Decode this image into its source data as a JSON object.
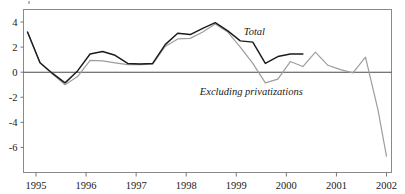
{
  "chart_data": {
    "type": "line",
    "title": "",
    "subtitle": "",
    "xlabel": "",
    "ylabel": "",
    "grid": false,
    "legend_position": "inline-annotations",
    "xlim": [
      1994.75,
      2002.1
    ],
    "ylim": [
      -8.0,
      5.0
    ],
    "yticks": [
      4,
      2,
      0,
      -2,
      -4,
      -6
    ],
    "ytick_labels": [
      "4",
      "2",
      "0",
      "-2",
      "-4",
      "-6"
    ],
    "xticks": [
      1995,
      1996,
      1997,
      1998,
      1999,
      2000,
      2001,
      2002
    ],
    "xtick_labels": [
      "1995",
      "1996",
      "1997",
      "1998",
      "1999",
      "2000",
      "2001",
      "2002"
    ],
    "annotations": [
      {
        "text": "Total",
        "x": 1999.15,
        "y": 3.0
      },
      {
        "text": "Excluding privatizations",
        "x": 1999.3,
        "y": -1.85
      }
    ],
    "series": [
      {
        "name": "Total",
        "color": "#1b1b1b",
        "x": [
          1994.83,
          1995.08,
          1995.33,
          1995.58,
          1995.83,
          1996.08,
          1996.33,
          1996.58,
          1996.83,
          1997.08,
          1997.33,
          1997.58,
          1997.83,
          1998.08,
          1998.33,
          1998.58,
          1998.83,
          1999.08,
          1999.33,
          1999.58,
          1999.83,
          2000.08,
          2000.33
        ],
        "values": [
          3.2,
          0.75,
          -0.1,
          -0.85,
          0.1,
          1.45,
          1.65,
          1.35,
          0.7,
          0.65,
          0.7,
          2.2,
          3.1,
          3.0,
          3.5,
          3.95,
          3.3,
          2.5,
          2.4,
          0.7,
          1.25,
          1.45,
          1.45
        ]
      },
      {
        "name": "Excluding privatizations",
        "color": "#9d9d9d",
        "x": [
          1994.83,
          1995.08,
          1995.33,
          1995.58,
          1995.83,
          1996.08,
          1996.33,
          1996.58,
          1996.83,
          1997.08,
          1997.33,
          1997.58,
          1997.83,
          1998.08,
          1998.33,
          1998.58,
          1998.83,
          1999.08,
          1999.33,
          1999.58,
          1999.83,
          2000.08,
          2000.33,
          2000.58,
          2000.83,
          2001.08,
          2001.33,
          2001.58,
          2001.83,
          2002.0
        ],
        "values": [
          3.2,
          0.75,
          -0.15,
          -1.0,
          -0.35,
          0.95,
          0.9,
          0.75,
          0.6,
          0.6,
          0.65,
          2.05,
          2.65,
          2.7,
          3.2,
          3.85,
          3.2,
          2.0,
          0.7,
          -0.85,
          -0.55,
          0.85,
          0.45,
          1.6,
          0.55,
          0.2,
          -0.05,
          1.2,
          -3.0,
          -6.7
        ]
      }
    ]
  },
  "axes": {
    "ytick_labels": [
      "4",
      "2",
      "0",
      "-2",
      "-4",
      "-6"
    ],
    "xtick_labels": [
      "1995",
      "1996",
      "1997",
      "1998",
      "1999",
      "2000",
      "2001",
      "2002"
    ]
  },
  "labels": {
    "total": "Total",
    "excluding": "Excluding privatizations"
  }
}
